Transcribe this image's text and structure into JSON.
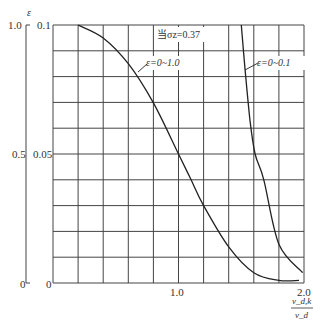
{
  "chart_data": {
    "type": "line",
    "title": "",
    "annotation": "当σz=0.37",
    "xlabel": "v_d,k / v_d",
    "xlabel_num": "v_d,k",
    "xlabel_den": "v_d",
    "ylabel": "ε",
    "xlim": [
      0,
      2.0
    ],
    "ylim_inner": [
      0,
      0.1
    ],
    "ylim_outer": [
      0,
      1.0
    ],
    "x_ticks": [
      "1.0",
      "2.0"
    ],
    "y_ticks_inner": [
      "0",
      "0.05",
      "0.1"
    ],
    "y_ticks_outer": [
      "0",
      "0.5",
      "1.0"
    ],
    "grid": true,
    "grid_cols": 10,
    "grid_rows": 10,
    "series": [
      {
        "name": "ε=0~1.0",
        "label": "ε=0~1.0",
        "axis": "outer",
        "x": [
          0.2,
          0.4,
          0.6,
          0.8,
          1.0,
          1.1,
          1.2,
          1.4,
          1.6,
          1.8,
          1.96
        ],
        "y": [
          0.1,
          0.095,
          0.085,
          0.0698,
          0.05,
          0.04,
          0.03,
          0.014,
          0.004,
          0.001,
          0.001
        ]
      },
      {
        "name": "ε=0~0.1",
        "label": "ε=0~0.1",
        "axis": "inner",
        "x": [
          1.5,
          1.53,
          1.57,
          1.61,
          1.68,
          1.8,
          1.99
        ],
        "y": [
          0.1,
          0.083,
          0.063,
          0.05,
          0.04,
          0.015,
          0.004
        ]
      }
    ]
  }
}
